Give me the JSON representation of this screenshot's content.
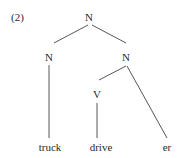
{
  "example_number": "(2)",
  "tree": {
    "root": {
      "label": "N"
    },
    "left_child": {
      "label": "N",
      "leaf": "truck"
    },
    "right_child": {
      "label": "N",
      "children": [
        {
          "label": "V",
          "leaf": "drive"
        },
        {
          "leaf": "er"
        }
      ]
    }
  }
}
